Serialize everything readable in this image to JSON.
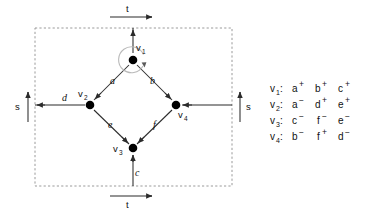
{
  "figure": {
    "title": "",
    "boundary": {
      "style": "dashed-rectangle",
      "color": "#9a9a9a"
    },
    "vertices": [
      {
        "id": "v1",
        "base": "v",
        "sub": "1",
        "x": 133,
        "y": 60
      },
      {
        "id": "v2",
        "base": "v",
        "sub": "2",
        "x": 90,
        "y": 105
      },
      {
        "id": "v3",
        "base": "v",
        "sub": "3",
        "x": 133,
        "y": 148
      },
      {
        "id": "v4",
        "base": "v",
        "sub": "4",
        "x": 176,
        "y": 105
      }
    ],
    "edge_labels": {
      "a": "a",
      "b": "b",
      "c": "c",
      "d": "d",
      "e": "e",
      "f": "f"
    },
    "boundary_labels": {
      "top": "t",
      "bottom": "t",
      "left": "s",
      "right": "s"
    }
  },
  "rotation_table": {
    "rows": [
      {
        "vertex_base": "v",
        "vertex_sub": "1",
        "entries": [
          {
            "letter": "a",
            "sign": "+"
          },
          {
            "letter": "b",
            "sign": "+"
          },
          {
            "letter": "c",
            "sign": "+"
          }
        ]
      },
      {
        "vertex_base": "v",
        "vertex_sub": "2",
        "entries": [
          {
            "letter": "a",
            "sign": "−"
          },
          {
            "letter": "d",
            "sign": "+"
          },
          {
            "letter": "e",
            "sign": "+"
          }
        ]
      },
      {
        "vertex_base": "v",
        "vertex_sub": "3",
        "entries": [
          {
            "letter": "c",
            "sign": "−"
          },
          {
            "letter": "f",
            "sign": "−"
          },
          {
            "letter": "e",
            "sign": "−"
          }
        ]
      },
      {
        "vertex_base": "v",
        "vertex_sub": "4",
        "entries": [
          {
            "letter": "b",
            "sign": "−"
          },
          {
            "letter": "f",
            "sign": "+"
          },
          {
            "letter": "d",
            "sign": "−"
          }
        ]
      }
    ],
    "separator": ":"
  },
  "colors": {
    "node": "#000000",
    "edge": "#2b2b2b",
    "boundary": "#9a9a9a",
    "arc": "#b9b9b9",
    "text": "#111111",
    "background": "#ffffff"
  }
}
